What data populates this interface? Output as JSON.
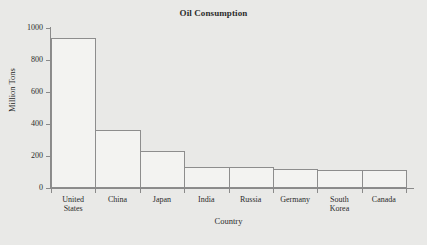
{
  "chart_data": {
    "type": "bar",
    "title": "Oil Consumption",
    "xlabel": "Country",
    "ylabel": "Million Tons",
    "categories": [
      "United States",
      "China",
      "Japan",
      "India",
      "Russia",
      "Germany",
      "South Korea",
      "Canada"
    ],
    "values": [
      940,
      362,
      231,
      131,
      131,
      119,
      115,
      113
    ],
    "ylim": [
      0,
      1000
    ],
    "yticks": [
      0,
      200,
      400,
      600,
      800,
      1000
    ],
    "ytick_labels": [
      "0",
      "200",
      "400",
      "600",
      "800",
      "1000"
    ],
    "grid": false,
    "legend": false,
    "bar_fill_color": "#f3f3f1",
    "bar_edge_color": "#8d8d8d",
    "axis_color": "#8a8a8a",
    "background_color": "#e9e9e7",
    "text_color": "#2b2b2b",
    "category_lines": [
      [
        "United",
        "States"
      ],
      [
        "China"
      ],
      [
        "Japan"
      ],
      [
        "India"
      ],
      [
        "Russia"
      ],
      [
        "Germany"
      ],
      [
        "South",
        "Korea"
      ],
      [
        "Canada"
      ]
    ]
  }
}
